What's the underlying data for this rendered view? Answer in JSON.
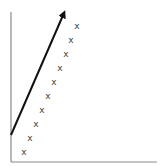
{
  "diagram": {
    "colors": {
      "axis": "#8a8a8a",
      "arrow": "#111111",
      "marks": "#444444",
      "background": "#ffffff"
    },
    "axes": {
      "origin": [
        11,
        162
      ],
      "y_top": [
        11,
        12
      ],
      "x_right": [
        157,
        162
      ]
    },
    "arrow": {
      "from": [
        11,
        135
      ],
      "to": [
        64,
        13
      ]
    },
    "marker_glyph": "x",
    "points": [
      {
        "x": 24,
        "y": 152,
        "label": "x"
      },
      {
        "x": 30,
        "y": 138,
        "label": "x"
      },
      {
        "x": 36,
        "y": 124,
        "label": "x"
      },
      {
        "x": 42,
        "y": 110,
        "label": "x"
      },
      {
        "x": 48,
        "y": 96,
        "label": "x"
      },
      {
        "x": 54,
        "y": 82,
        "label": "x"
      },
      {
        "x": 60,
        "y": 68,
        "label": "x"
      },
      {
        "x": 66,
        "y": 54,
        "label": "x"
      },
      {
        "x": 71,
        "y": 40,
        "label": "x"
      },
      {
        "x": 77,
        "y": 26,
        "label": "x"
      }
    ]
  }
}
